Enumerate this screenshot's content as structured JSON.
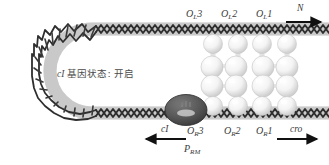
{
  "figure": {
    "caption_text": "cI 基因状态: 开启",
    "caption_italic_prefix": "cI",
    "caption_rest": " 基因状态: 开启",
    "background_color": "#ffffff",
    "dna_color_dark": "#2b2b2b",
    "dna_band_color": "#cfcfcf",
    "protein_sphere_color": "#f2f2f2",
    "polymerase_color": "#4d4d4d",
    "label_color": "#3b3b3b"
  },
  "operators_top": [
    {
      "id": "OL3",
      "base": "O",
      "sub": "L",
      "num": "3",
      "x": 188,
      "y": 10
    },
    {
      "id": "OL2",
      "base": "O",
      "sub": "L",
      "num": "2",
      "x": 222,
      "y": 10
    },
    {
      "id": "OL1",
      "base": "O",
      "sub": "L",
      "num": "1",
      "x": 257,
      "y": 10
    }
  ],
  "operators_bottom": [
    {
      "id": "OR3",
      "base": "O",
      "sub": "R",
      "num": "3",
      "x": 189,
      "y": 127
    },
    {
      "id": "OR2",
      "base": "O",
      "sub": "R",
      "num": "2",
      "x": 226,
      "y": 127
    },
    {
      "id": "OR1",
      "base": "O",
      "sub": "R",
      "num": "1",
      "x": 258,
      "y": 127
    }
  ],
  "promoter": {
    "base": "P",
    "sub": "RM",
    "x": 186,
    "y": 145
  },
  "genes": [
    {
      "id": "N",
      "label": "N",
      "direction": "right",
      "x": 299,
      "y": 7
    },
    {
      "id": "cI",
      "label": "cI",
      "direction": "left",
      "x": 163,
      "y": 127
    },
    {
      "id": "cro",
      "label": "cro",
      "direction": "right",
      "x": 293,
      "y": 127
    }
  ],
  "arrows": [
    {
      "id": "arrow-N",
      "x1": 286,
      "y1": 22,
      "x2": 324,
      "y2": 22,
      "dir": "right"
    },
    {
      "id": "arrow-cI",
      "x1": 184,
      "y1": 139,
      "x2": 143,
      "y2": 139,
      "dir": "left"
    },
    {
      "id": "arrow-cro",
      "x1": 277,
      "y1": 139,
      "x2": 320,
      "y2": 139,
      "dir": "right"
    }
  ],
  "protein_complex": {
    "name": "CI repressor octamer",
    "columns": 4,
    "spheres_per_column": 4,
    "column_x": [
      213,
      238,
      262,
      287
    ],
    "top_y": 45,
    "mid_upper_y": 66,
    "mid_lower_y": 85,
    "bottom_y": 106
  },
  "polymerase": {
    "name": "RNA polymerase",
    "cx": 186,
    "cy": 110,
    "rx": 21,
    "ry": 15
  }
}
